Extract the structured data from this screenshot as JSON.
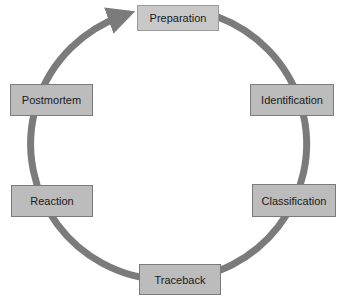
{
  "diagram": {
    "type": "cycle",
    "direction": "clockwise",
    "colors": {
      "background": "#ffffff",
      "arc": "#7b7b7b",
      "box_fill": "#bcbcbc",
      "box_border": "#7a7a7a",
      "text": "#1a1a1a"
    },
    "stages": [
      {
        "label": "Preparation"
      },
      {
        "label": "Identification"
      },
      {
        "label": "Classification"
      },
      {
        "label": "Traceback"
      },
      {
        "label": "Reaction"
      },
      {
        "label": "Postmortem"
      }
    ]
  }
}
